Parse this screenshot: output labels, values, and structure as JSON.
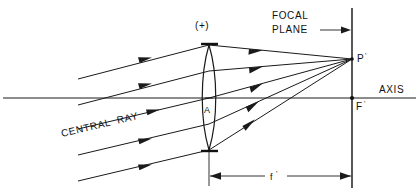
{
  "diagram": {
    "labels": {
      "lens_sign": "(+)",
      "lens_center": "A",
      "focal_plane_line1": "FOCAL",
      "focal_plane_line2": "PLANE",
      "image_point": "P",
      "image_point_prime": "'",
      "focal_point": "F",
      "focal_point_prime": "'",
      "axis": "AXIS",
      "central_ray": "CENTRAL  RAY",
      "focal_length": "f",
      "focal_length_prime": "'"
    },
    "colors": {
      "ink": "#1a1a1a",
      "background": "#ffffff",
      "dimension": "#333333"
    },
    "geometry": {
      "axis_y": 98,
      "axis_x_start": 3,
      "axis_x_end": 416,
      "lens_center_x": 209,
      "lens_top_y": 45,
      "lens_bottom_y": 150,
      "lens_half_width": 9,
      "focal_plane_x": 352,
      "focal_plane_y_top": 8,
      "focal_plane_y_bottom": 188,
      "image_point_x": 352,
      "image_point_y": 59,
      "focal_point_x": 352,
      "focal_point_y": 98,
      "ray_slope_dy_dx": -0.238,
      "dimension_y": 176,
      "dimension_x_start": 209,
      "dimension_x_end": 352
    },
    "incoming_rays": [
      {
        "name": "ray-1",
        "x_start": 78,
        "y_start": 79,
        "x_end": 209,
        "y_end": 45
      },
      {
        "name": "ray-2",
        "x_start": 78,
        "y_start": 105,
        "x_end": 209,
        "y_end": 71
      },
      {
        "name": "ray-3-central",
        "x_start": 78,
        "y_start": 129,
        "x_end": 209,
        "y_end": 98
      },
      {
        "name": "ray-4",
        "x_start": 78,
        "y_start": 155,
        "x_end": 209,
        "y_end": 124
      },
      {
        "name": "ray-5",
        "x_start": 78,
        "y_start": 181,
        "x_end": 209,
        "y_end": 150
      }
    ],
    "outgoing_rays": [
      {
        "name": "out-ray-1",
        "x_start": 209,
        "y_start": 45,
        "x_end": 352,
        "y_end": 59
      },
      {
        "name": "out-ray-2",
        "x_start": 209,
        "y_start": 71,
        "x_end": 352,
        "y_end": 59
      },
      {
        "name": "out-ray-3",
        "x_start": 209,
        "y_start": 98,
        "x_end": 352,
        "y_end": 59
      },
      {
        "name": "out-ray-4",
        "x_start": 209,
        "y_start": 124,
        "x_end": 352,
        "y_end": 59
      },
      {
        "name": "out-ray-5",
        "x_start": 209,
        "y_start": 150,
        "x_end": 352,
        "y_end": 59
      }
    ]
  }
}
